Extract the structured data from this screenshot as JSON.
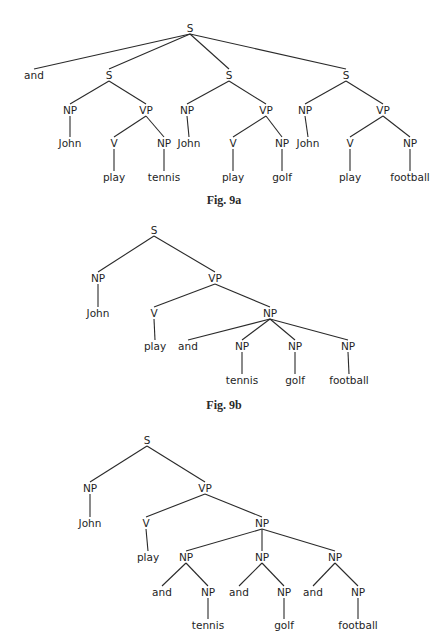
{
  "figures": [
    {
      "id": "fig9a",
      "caption": "Fig. 9a",
      "caption_pos": [
        224,
        200
      ],
      "nodes": [
        {
          "id": "S",
          "label": "S",
          "x": 190,
          "y": 28
        },
        {
          "id": "and",
          "label": "and",
          "x": 34,
          "y": 75
        },
        {
          "id": "S1",
          "label": "S",
          "x": 109,
          "y": 75
        },
        {
          "id": "S2",
          "label": "S",
          "x": 229,
          "y": 75
        },
        {
          "id": "S3",
          "label": "S",
          "x": 346,
          "y": 75
        },
        {
          "id": "S1_NP",
          "label": "NP",
          "x": 70,
          "y": 110
        },
        {
          "id": "S1_VP",
          "label": "VP",
          "x": 146,
          "y": 110
        },
        {
          "id": "S1_John",
          "label": "John",
          "x": 70,
          "y": 143
        },
        {
          "id": "S1_V",
          "label": "V",
          "x": 114,
          "y": 143
        },
        {
          "id": "S1_NP2",
          "label": "NP",
          "x": 164,
          "y": 143
        },
        {
          "id": "S1_play",
          "label": "play",
          "x": 114,
          "y": 177
        },
        {
          "id": "S1_tennis",
          "label": "tennis",
          "x": 164,
          "y": 177
        },
        {
          "id": "S2_NP",
          "label": "NP",
          "x": 187,
          "y": 110
        },
        {
          "id": "S2_VP",
          "label": "VP",
          "x": 266,
          "y": 110
        },
        {
          "id": "S2_John",
          "label": "John",
          "x": 189,
          "y": 143
        },
        {
          "id": "S2_V",
          "label": "V",
          "x": 233,
          "y": 143
        },
        {
          "id": "S2_NP2",
          "label": "NP",
          "x": 282,
          "y": 143
        },
        {
          "id": "S2_play",
          "label": "play",
          "x": 233,
          "y": 177
        },
        {
          "id": "S2_golf",
          "label": "golf",
          "x": 282,
          "y": 177
        },
        {
          "id": "S3_NP",
          "label": "NP",
          "x": 305,
          "y": 110
        },
        {
          "id": "S3_VP",
          "label": "VP",
          "x": 383,
          "y": 110
        },
        {
          "id": "S3_John",
          "label": "John",
          "x": 308,
          "y": 143
        },
        {
          "id": "S3_V",
          "label": "V",
          "x": 350,
          "y": 143
        },
        {
          "id": "S3_NP2",
          "label": "NP",
          "x": 410,
          "y": 143
        },
        {
          "id": "S3_play",
          "label": "play",
          "x": 350,
          "y": 177
        },
        {
          "id": "S3_football",
          "label": "football",
          "x": 410,
          "y": 177
        }
      ],
      "edges": [
        [
          "S",
          "and"
        ],
        [
          "S",
          "S1"
        ],
        [
          "S",
          "S2"
        ],
        [
          "S",
          "S3"
        ],
        [
          "S1",
          "S1_NP"
        ],
        [
          "S1",
          "S1_VP"
        ],
        [
          "S1_NP",
          "S1_John"
        ],
        [
          "S1_VP",
          "S1_V"
        ],
        [
          "S1_VP",
          "S1_NP2"
        ],
        [
          "S1_V",
          "S1_play"
        ],
        [
          "S1_NP2",
          "S1_tennis"
        ],
        [
          "S2",
          "S2_NP"
        ],
        [
          "S2",
          "S2_VP"
        ],
        [
          "S2_NP",
          "S2_John"
        ],
        [
          "S2_VP",
          "S2_V"
        ],
        [
          "S2_VP",
          "S2_NP2"
        ],
        [
          "S2_V",
          "S2_play"
        ],
        [
          "S2_NP2",
          "S2_golf"
        ],
        [
          "S3",
          "S3_NP"
        ],
        [
          "S3",
          "S3_VP"
        ],
        [
          "S3_NP",
          "S3_John"
        ],
        [
          "S3_VP",
          "S3_V"
        ],
        [
          "S3_VP",
          "S3_NP2"
        ],
        [
          "S3_V",
          "S3_play"
        ],
        [
          "S3_NP2",
          "S3_football"
        ]
      ]
    },
    {
      "id": "fig9b",
      "caption": "Fig. 9b",
      "caption_pos": [
        224,
        405
      ],
      "nodes": [
        {
          "id": "S",
          "label": "S",
          "x": 154,
          "y": 230
        },
        {
          "id": "NP",
          "label": "NP",
          "x": 98,
          "y": 278
        },
        {
          "id": "VP",
          "label": "VP",
          "x": 215,
          "y": 278
        },
        {
          "id": "John",
          "label": "John",
          "x": 98,
          "y": 313
        },
        {
          "id": "V",
          "label": "V",
          "x": 154,
          "y": 313
        },
        {
          "id": "NPc",
          "label": "NP",
          "x": 270,
          "y": 313
        },
        {
          "id": "play",
          "label": "play",
          "x": 155,
          "y": 346
        },
        {
          "id": "and",
          "label": "and",
          "x": 188,
          "y": 346
        },
        {
          "id": "NP1",
          "label": "NP",
          "x": 242,
          "y": 346
        },
        {
          "id": "NP2",
          "label": "NP",
          "x": 295,
          "y": 346
        },
        {
          "id": "NP3",
          "label": "NP",
          "x": 348,
          "y": 346
        },
        {
          "id": "tennis",
          "label": "tennis",
          "x": 242,
          "y": 380
        },
        {
          "id": "golf",
          "label": "golf",
          "x": 295,
          "y": 380
        },
        {
          "id": "football",
          "label": "football",
          "x": 349,
          "y": 380
        }
      ],
      "edges": [
        [
          "S",
          "NP"
        ],
        [
          "S",
          "VP"
        ],
        [
          "NP",
          "John"
        ],
        [
          "VP",
          "V"
        ],
        [
          "VP",
          "NPc"
        ],
        [
          "V",
          "play"
        ],
        [
          "NPc",
          "and"
        ],
        [
          "NPc",
          "NP1"
        ],
        [
          "NPc",
          "NP2"
        ],
        [
          "NPc",
          "NP3"
        ],
        [
          "NP1",
          "tennis"
        ],
        [
          "NP2",
          "golf"
        ],
        [
          "NP3",
          "football"
        ]
      ]
    },
    {
      "id": "fig9c",
      "caption": "",
      "caption_pos": null,
      "nodes": [
        {
          "id": "S",
          "label": "S",
          "x": 147,
          "y": 440
        },
        {
          "id": "NP",
          "label": "NP",
          "x": 90,
          "y": 488
        },
        {
          "id": "VP",
          "label": "VP",
          "x": 205,
          "y": 488
        },
        {
          "id": "John",
          "label": "John",
          "x": 90,
          "y": 523
        },
        {
          "id": "V",
          "label": "V",
          "x": 146,
          "y": 523
        },
        {
          "id": "NPc",
          "label": "NP",
          "x": 262,
          "y": 523
        },
        {
          "id": "play",
          "label": "play",
          "x": 148,
          "y": 557
        },
        {
          "id": "NPa",
          "label": "NP",
          "x": 186,
          "y": 557
        },
        {
          "id": "NPb",
          "label": "NP",
          "x": 262,
          "y": 557
        },
        {
          "id": "NPd",
          "label": "NP",
          "x": 335,
          "y": 557
        },
        {
          "id": "and1",
          "label": "and",
          "x": 162,
          "y": 592
        },
        {
          "id": "NPa2",
          "label": "NP",
          "x": 208,
          "y": 592
        },
        {
          "id": "and2",
          "label": "and",
          "x": 239,
          "y": 592
        },
        {
          "id": "NPb2",
          "label": "NP",
          "x": 284,
          "y": 592
        },
        {
          "id": "and3",
          "label": "and",
          "x": 313,
          "y": 592
        },
        {
          "id": "NPd2",
          "label": "NP",
          "x": 358,
          "y": 592
        },
        {
          "id": "tennis",
          "label": "tennis",
          "x": 208,
          "y": 625
        },
        {
          "id": "golf",
          "label": "golf",
          "x": 284,
          "y": 625
        },
        {
          "id": "football",
          "label": "football",
          "x": 358,
          "y": 625
        }
      ],
      "edges": [
        [
          "S",
          "NP"
        ],
        [
          "S",
          "VP"
        ],
        [
          "NP",
          "John"
        ],
        [
          "VP",
          "V"
        ],
        [
          "VP",
          "NPc"
        ],
        [
          "V",
          "play"
        ],
        [
          "NPc",
          "NPa"
        ],
        [
          "NPc",
          "NPb"
        ],
        [
          "NPc",
          "NPd"
        ],
        [
          "NPa",
          "and1"
        ],
        [
          "NPa",
          "NPa2"
        ],
        [
          "NPa2",
          "tennis"
        ],
        [
          "NPb",
          "and2"
        ],
        [
          "NPb",
          "NPb2"
        ],
        [
          "NPb2",
          "golf"
        ],
        [
          "NPd",
          "and3"
        ],
        [
          "NPd",
          "NPd2"
        ],
        [
          "NPd2",
          "football"
        ]
      ]
    }
  ]
}
